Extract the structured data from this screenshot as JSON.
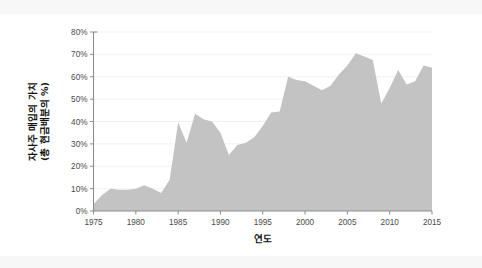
{
  "chart_data": {
    "type": "area",
    "title": "",
    "xlabel": "연도",
    "ylabel": "자사주 매입의 가치\n(총 현금배분의 %)",
    "ylabel_line1": "자사주 매입의 가치",
    "ylabel_line2": "(총 현금배분의 %)",
    "xlim": [
      1975,
      2015
    ],
    "ylim": [
      0,
      80
    ],
    "grid": true,
    "legend": "none",
    "fill_color": "#c3c3c3",
    "axis_color": "#8d8d8d",
    "grid_color": "#ececef",
    "background_color": "#ffffff",
    "band_color": "#f7f7f8",
    "x_ticks": [
      1975,
      1980,
      1985,
      1990,
      1995,
      2000,
      2005,
      2010,
      2015
    ],
    "x_tick_labels": [
      "1975",
      "1980",
      "1985",
      "1990",
      "1995",
      "2000",
      "2005",
      "2010",
      "2015"
    ],
    "y_ticks": [
      0,
      10,
      20,
      30,
      40,
      50,
      60,
      70,
      80
    ],
    "y_tick_labels": [
      "0%",
      "10%",
      "20%",
      "30%",
      "40%",
      "50%",
      "60%",
      "70%",
      "80%"
    ],
    "x": [
      1975,
      1976,
      1977,
      1978,
      1979,
      1980,
      1981,
      1982,
      1983,
      1984,
      1985,
      1986,
      1987,
      1988,
      1989,
      1990,
      1991,
      1992,
      1993,
      1994,
      1995,
      1996,
      1997,
      1998,
      1999,
      2000,
      2001,
      2002,
      2003,
      2004,
      2005,
      2006,
      2007,
      2008,
      2009,
      2010,
      2011,
      2012,
      2013,
      2014,
      2015
    ],
    "values": [
      3,
      7,
      10,
      9.5,
      9.5,
      10,
      11.5,
      10,
      8,
      14,
      39.5,
      30.5,
      43.5,
      41,
      40,
      35,
      25,
      29.5,
      30.5,
      33,
      38,
      44,
      44.5,
      60,
      58.5,
      58,
      56,
      54,
      56,
      61,
      65,
      70.5,
      69,
      67.5,
      48,
      55,
      63,
      56.5,
      58,
      65,
      64
    ]
  },
  "figure": {
    "top_band_label": "page-band-top",
    "bottom_band_label": "page-band-bottom"
  }
}
